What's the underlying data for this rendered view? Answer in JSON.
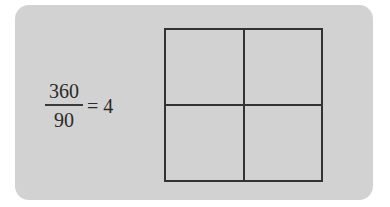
{
  "equation": {
    "numerator": "360",
    "denominator": "90",
    "equals": "= 4"
  },
  "diagram": {
    "shape": "square divided into 4 equal quadrants",
    "rows": 2,
    "columns": 2
  },
  "colors": {
    "panel_background": "#d2d2d2",
    "line": "#333333",
    "text": "#2a2a2a"
  }
}
